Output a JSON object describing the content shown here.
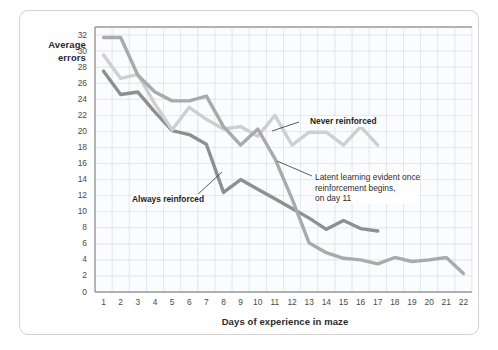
{
  "figure": {
    "x_axis_title": "Days of experience in maze",
    "y_axis_title": "Average\nerrors",
    "y_axis_title_line1": "Average",
    "y_axis_title_line2": "errors"
  },
  "annotations": {
    "never": "Never reinforced",
    "always": "Always reinforced",
    "latent": "Latent learning evident once\nreinforcement begins,\non day 11"
  },
  "colors": {
    "always_reinforced": "#8f8f8f",
    "never_reinforced": "#cfcfcf",
    "latent_learning": "#aaaaaa",
    "grid": "#c8d4e2",
    "axis": "#9a9a9a",
    "card_border": "#d2d2d2",
    "text": "#2b2b2b",
    "tick_text": "#4a4a4a"
  },
  "chart_data": {
    "type": "line",
    "title": "",
    "xlabel": "Days of experience in maze",
    "ylabel": "Average errors",
    "xlim": [
      0,
      22
    ],
    "ylim": [
      0,
      33
    ],
    "yticks": [
      0,
      2,
      4,
      6,
      8,
      10,
      12,
      14,
      16,
      18,
      20,
      22,
      24,
      26,
      28,
      30,
      32
    ],
    "xticks": [
      1,
      2,
      3,
      4,
      5,
      6,
      7,
      8,
      9,
      10,
      11,
      12,
      13,
      14,
      15,
      16,
      17,
      18,
      19,
      20,
      21,
      22
    ],
    "grid": true,
    "legend": "annotations-inline",
    "x": [
      1,
      2,
      3,
      4,
      5,
      6,
      7,
      8,
      9,
      10,
      11,
      12,
      13,
      14,
      15,
      16,
      17,
      18,
      19,
      20,
      21,
      22
    ],
    "series": [
      {
        "name": "Always reinforced",
        "color": "#8f8f8f",
        "x": [
          1,
          2,
          3,
          4,
          5,
          6,
          7,
          8,
          9,
          10,
          11,
          12,
          13,
          14,
          15,
          16,
          17
        ],
        "values": [
          27.5,
          24.6,
          24.9,
          22.4,
          20.1,
          19.6,
          18.4,
          12.4,
          14.0,
          12.8,
          11.6,
          10.4,
          9.2,
          7.8,
          8.9,
          7.9,
          7.6
        ]
      },
      {
        "name": "Never reinforced",
        "color": "#cfcfcf",
        "x": [
          1,
          2,
          3,
          4,
          5,
          6,
          7,
          8,
          9,
          10,
          11,
          12,
          13,
          14,
          15,
          16,
          17
        ],
        "values": [
          29.5,
          26.6,
          27.1,
          23.4,
          20.2,
          23.0,
          21.5,
          20.3,
          20.6,
          19.4,
          22.0,
          18.3,
          19.9,
          19.9,
          18.3,
          20.6,
          18.3
        ]
      },
      {
        "name": "Latent learning (no reward until day 11)",
        "color": "#aaaaaa",
        "x": [
          1,
          2,
          3,
          4,
          5,
          6,
          7,
          8,
          9,
          10,
          11,
          12,
          13,
          14,
          15,
          16,
          17,
          18,
          19,
          20,
          21,
          22
        ],
        "values": [
          31.7,
          31.7,
          27.0,
          24.9,
          23.8,
          23.8,
          24.4,
          20.6,
          18.3,
          20.3,
          16.6,
          11.6,
          6.1,
          4.9,
          4.2,
          4.0,
          3.5,
          4.3,
          3.8,
          4.0,
          4.3,
          2.3
        ]
      }
    ]
  }
}
